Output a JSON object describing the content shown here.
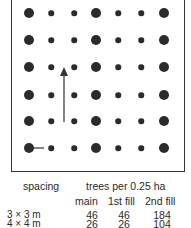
{
  "diagram": {
    "rows": 6,
    "columns": 7,
    "column_types": [
      "main",
      "fill",
      "fill",
      "main",
      "fill",
      "fill",
      "main"
    ],
    "arrows": [
      "vertical-arrow-up",
      "horizontal-spacing-line"
    ]
  },
  "table": {
    "header_spacing": "spacing",
    "header_group": "trees per 0.25 ha",
    "subheaders": [
      "main",
      "1st fill",
      "2nd fill"
    ],
    "rows": [
      {
        "spacing": "3 × 3 m",
        "main": "46",
        "fill1": "46",
        "fill2": "184"
      },
      {
        "spacing": "4 × 4 m",
        "main": "26",
        "fill1": "26",
        "fill2": "104"
      }
    ]
  }
}
